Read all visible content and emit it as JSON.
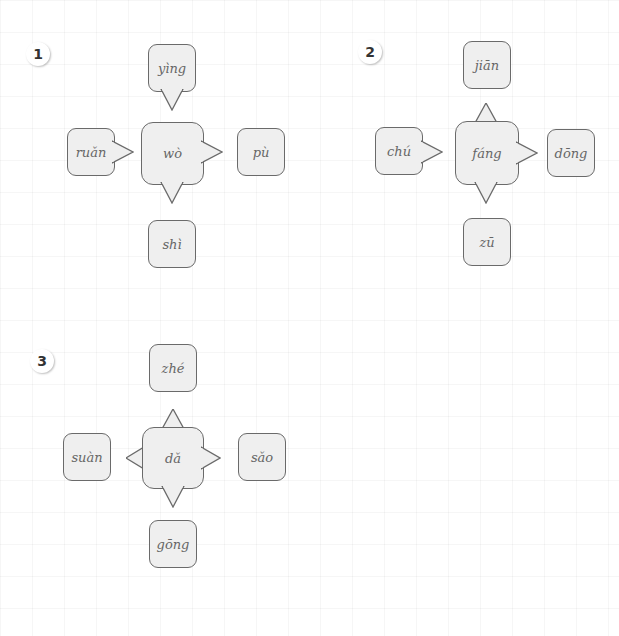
{
  "exercises": [
    {
      "number": "1",
      "center": "wò",
      "top": "yìng",
      "left": "ruǎn",
      "right": "pù",
      "bottom": "shì"
    },
    {
      "number": "2",
      "center": "fáng",
      "top": "jiān",
      "left": "chú",
      "right": "dōng",
      "bottom": "zū"
    },
    {
      "number": "3",
      "center": "dǎ",
      "top": "zhé",
      "left": "suàn",
      "right": "sǎo",
      "bottom": "gōng"
    }
  ]
}
